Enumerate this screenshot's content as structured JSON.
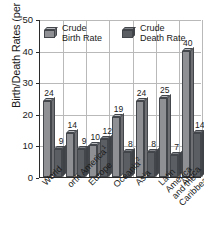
{
  "chart_data": {
    "type": "bar",
    "title": "",
    "subtitle": "",
    "xlabel": "",
    "ylabel": "Birth/Death Rates (per 1000 population)",
    "ylim": [
      0,
      50
    ],
    "yticks": [
      0,
      10,
      20,
      30,
      40,
      50
    ],
    "grid": true,
    "legend_position": "top-inside",
    "orientation": "vertical",
    "style": "3d-grouped-bars-grayscale",
    "categories": [
      "World",
      "North America",
      "Europe",
      "Oceania",
      "Asia",
      "Latin America and the Caribbean",
      "Africa"
    ],
    "category_footnotes": [
      "",
      "1",
      "",
      "2",
      "",
      "",
      ""
    ],
    "series": [
      {
        "name": "Crude Birth Rate",
        "color": "#8e9094",
        "values": [
          24,
          14,
          10,
          19,
          24,
          25,
          40
        ]
      },
      {
        "name": "Crude Death Rate",
        "color": "#5b5e63",
        "values": [
          9,
          9,
          12,
          8,
          8,
          7,
          14
        ]
      }
    ]
  },
  "legend": {
    "items": [
      {
        "label": "Crude\nBirth Rate"
      },
      {
        "label": "Crude\nDeath Rate"
      }
    ]
  },
  "axis": {
    "y_title": "Birth/Death Rates (per 1000 population)",
    "y_tick_labels": [
      "0",
      "10",
      "20",
      "30",
      "40",
      "50"
    ]
  },
  "x_labels": [
    {
      "text": "World",
      "footnote": ""
    },
    {
      "text": "orth America",
      "footnote": "1"
    },
    {
      "text": "Europe",
      "footnote": ""
    },
    {
      "text": "Oceania",
      "footnote": "2"
    },
    {
      "text": "Asia",
      "footnote": ""
    },
    {
      "text": "Latin America\nand the\nCaribbean",
      "footnote": ""
    },
    {
      "text": "Africa",
      "footnote": ""
    }
  ],
  "value_labels": {
    "birth": [
      "24",
      "14",
      "10",
      "19",
      "24",
      "25",
      "40"
    ],
    "death": [
      "9",
      "9",
      "12",
      "8",
      "8",
      "7",
      "14"
    ]
  }
}
